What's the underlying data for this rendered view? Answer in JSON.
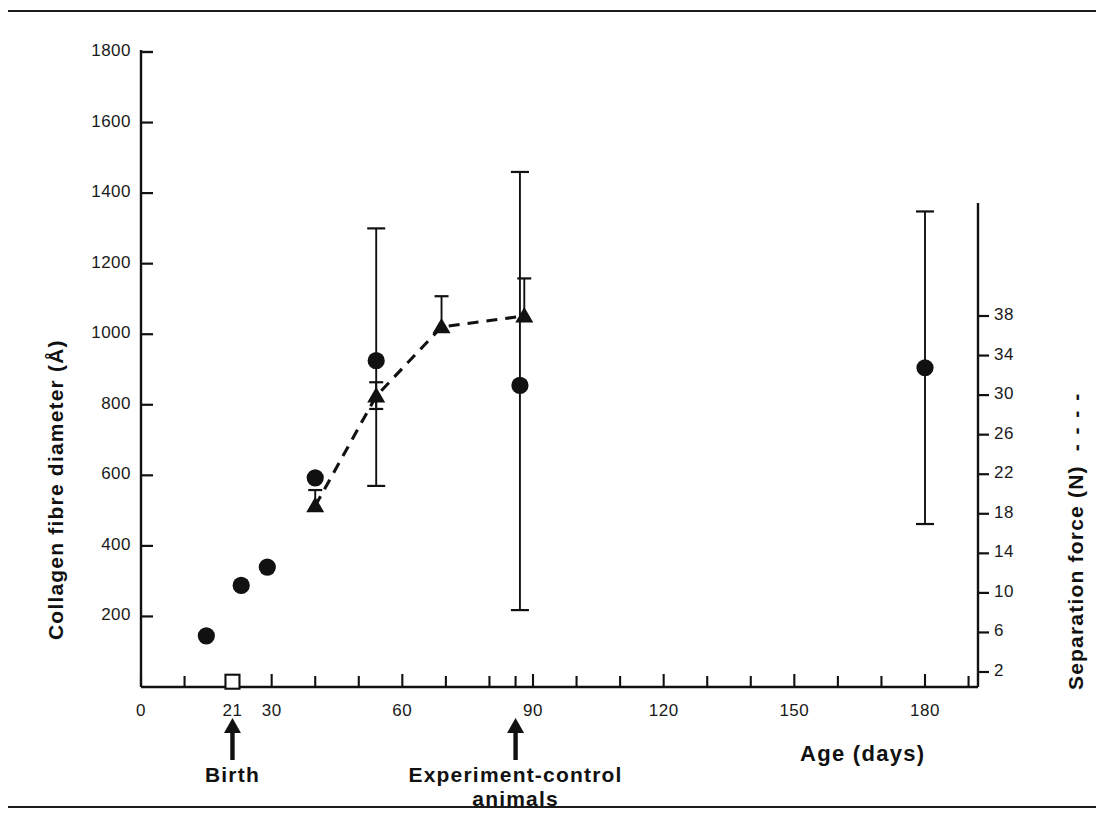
{
  "figure": {
    "background": "#ffffff",
    "ink": "#111111",
    "width": 1104,
    "height": 818
  },
  "chart_data": {
    "type": "scatter",
    "title": "",
    "subtitle": "",
    "xlabel": "Age (days)",
    "ylabel": "Collagen fibre diameter (Å)",
    "y2label": "Separation force (N)",
    "y2label_legend_dash": "- - - -",
    "xlim": [
      0,
      200
    ],
    "ylim": [
      0,
      1800
    ],
    "y2lim": [
      0,
      40
    ],
    "grid": false,
    "legend": "none",
    "xticks": [
      0,
      10,
      20,
      21,
      30,
      40,
      50,
      60,
      70,
      80,
      86,
      90,
      100,
      110,
      120,
      130,
      140,
      150,
      160,
      170,
      180,
      190
    ],
    "xtick_labels": [
      {
        "value": 0,
        "text": "0"
      },
      {
        "value": 21,
        "text": "21"
      },
      {
        "value": 30,
        "text": "30"
      },
      {
        "value": 60,
        "text": "60"
      },
      {
        "value": 90,
        "text": "90"
      },
      {
        "value": 120,
        "text": "120"
      },
      {
        "value": 150,
        "text": "150"
      },
      {
        "value": 180,
        "text": "180"
      }
    ],
    "yticks": [
      200,
      400,
      600,
      800,
      1000,
      1200,
      1400,
      1600,
      1800
    ],
    "ytick_labels": [
      "200",
      "400",
      "600",
      "800",
      "1000",
      "1200",
      "1400",
      "1600",
      "1800"
    ],
    "y2ticks": [
      2,
      6,
      10,
      14,
      18,
      22,
      26,
      30,
      34,
      38
    ],
    "y2tick_labels": [
      "2",
      "6",
      "10",
      "14",
      "18",
      "22",
      "26",
      "30",
      "34",
      "38"
    ],
    "series": [
      {
        "name": "Collagen fibre diameter",
        "marker": "filled-circle",
        "axis": "left",
        "connected": false,
        "points": [
          {
            "x": 15,
            "y": 145
          },
          {
            "x": 21,
            "y": 15,
            "marker": "open-square"
          },
          {
            "x": 23,
            "y": 288
          },
          {
            "x": 29,
            "y": 340
          },
          {
            "x": 40,
            "y": 593
          },
          {
            "x": 54,
            "y": 925,
            "yerr_low": 570,
            "yerr_high": 1300
          },
          {
            "x": 87,
            "y": 855,
            "yerr_low": 218,
            "yerr_high": 1460
          },
          {
            "x": 180,
            "y": 905,
            "yerr_low": 462,
            "yerr_high": 1348
          }
        ]
      },
      {
        "name": "Separation force",
        "marker": "filled-triangle",
        "axis": "right",
        "connected": true,
        "linestyle": "dashed",
        "points": [
          {
            "x": 40,
            "y": 18.8,
            "yerr_low": 18.8,
            "yerr_high": 20.4
          },
          {
            "x": 54,
            "y": 29.9,
            "yerr_low": 28.6,
            "yerr_high": 31.3
          },
          {
            "x": 69,
            "y": 36.9,
            "yerr_low": 36.9,
            "yerr_high": 40.0
          },
          {
            "x": 88,
            "y": 38.0,
            "yerr_low": 38.0,
            "yerr_high": 41.8
          }
        ]
      }
    ],
    "annotations": [
      {
        "x": 21,
        "text": "Birth",
        "arrow": "up"
      },
      {
        "x": 86,
        "text": "Experiment-control\nanimals",
        "arrow": "up"
      }
    ]
  }
}
